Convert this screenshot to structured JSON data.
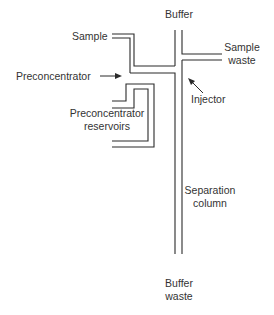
{
  "diagram": {
    "type": "microfluidic-chip-schematic",
    "labels": {
      "buffer": "Buffer",
      "sample": "Sample",
      "sample_waste_1": "Sample",
      "sample_waste_2": "waste",
      "preconcentrator": "Preconcentrator",
      "injector": "Injector",
      "reservoirs_1": "Preconcentrator",
      "reservoirs_2": "reservoirs",
      "separation_1": "Separation",
      "separation_2": "column",
      "buffer_waste_1": "Buffer",
      "buffer_waste_2": "waste"
    },
    "colors": {
      "line": "#2b2b2b",
      "text": "#333333",
      "background": "#ffffff"
    }
  }
}
